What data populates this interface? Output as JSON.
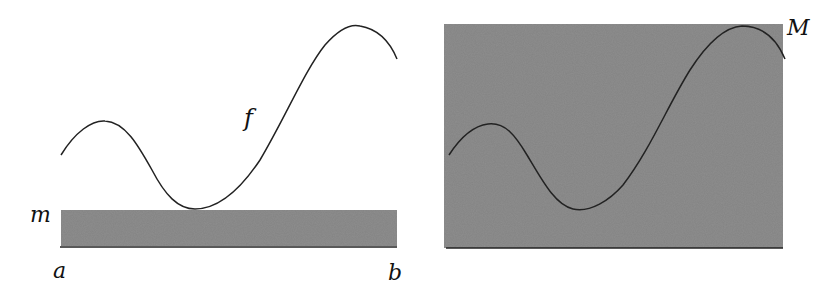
{
  "left_figure": {
    "function_label": "f",
    "min_label": "m",
    "interval_start_label": "a",
    "interval_end_label": "b",
    "band_color": "#8e8e8e"
  },
  "right_figure": {
    "max_label": "M",
    "fill_color": "#8e8e8e"
  },
  "curve_color": "#222222"
}
